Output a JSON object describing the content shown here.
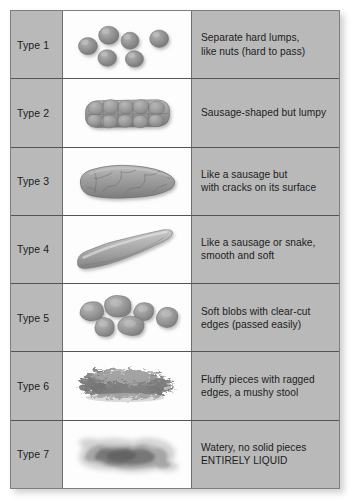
{
  "chart": {
    "columns": {
      "type_header": "",
      "art_header": "",
      "description_header": ""
    },
    "accent_colors": {
      "table_background": "#b9b9b9",
      "art_background": "#fdfdfd",
      "grid_line": "#555555",
      "text": "#1c1c1c",
      "stool_fill": "#8f8f8f",
      "stool_fill_light": "#b2b2b2",
      "stool_fill_dark": "#6f6f6f"
    },
    "rows": [
      {
        "type_label": "Type 1",
        "art_name": "separate-hard-lumps-art",
        "description": "Separate hard lumps,\nlike nuts (hard to pass)"
      },
      {
        "type_label": "Type 2",
        "art_name": "lumpy-sausage-art",
        "description": "Sausage-shaped but lumpy"
      },
      {
        "type_label": "Type 3",
        "art_name": "cracked-sausage-art",
        "description": "Like a sausage but\nwith cracks on its surface"
      },
      {
        "type_label": "Type 4",
        "art_name": "smooth-sausage-art",
        "description": "Like a sausage or snake,\nsmooth and soft"
      },
      {
        "type_label": "Type 5",
        "art_name": "soft-blobs-art",
        "description": "Soft blobs with clear-cut\nedges (passed easily)"
      },
      {
        "type_label": "Type 6",
        "art_name": "fluffy-ragged-pieces-art",
        "description": "Fluffy pieces with ragged\nedges, a mushy stool"
      },
      {
        "type_label": "Type 7",
        "art_name": "watery-liquid-art",
        "description": "Watery, no solid pieces\nENTIRELY LIQUID"
      }
    ]
  }
}
